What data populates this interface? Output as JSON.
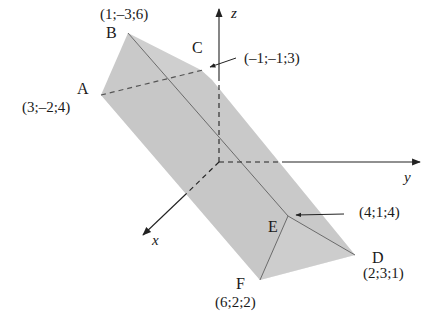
{
  "figure": {
    "axes": {
      "x": "x",
      "y": "y",
      "z": "z"
    },
    "vertices": [
      {
        "name": "A",
        "coords": "(3;–2;4)"
      },
      {
        "name": "B",
        "coords": "(1;–3;6)"
      },
      {
        "name": "C",
        "coords": "(–1;–1;3)"
      },
      {
        "name": "D",
        "coords": "(2;3;1)"
      },
      {
        "name": "E",
        "coords": "(4;1;4)"
      },
      {
        "name": "F",
        "coords": "(6;2;2)"
      }
    ],
    "colors": {
      "prism_fill": "#c8c8c8",
      "prism_face_light": "#d6d6d6",
      "edge": "#555555",
      "axis": "#222222"
    }
  }
}
